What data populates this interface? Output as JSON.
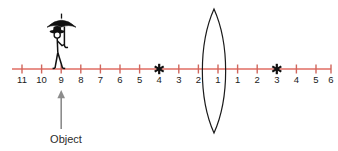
{
  "figure": {
    "kind": "optics-ray-diagram",
    "background_color": "#ffffff",
    "axis": {
      "name": "optical-axis",
      "color": "#e8918a",
      "stroke_width": 2.1,
      "x_start": 12,
      "x_end": 331,
      "y": 69,
      "tick_color": "#d0665c",
      "tick_half_height": 4.5,
      "tick_spacing": 19.6,
      "tick_label_y": 83
    },
    "left_scale": {
      "label": "object-side-distance-scale",
      "labels": [
        "11",
        "10",
        "9",
        "8",
        "7",
        "6",
        "5",
        "4",
        "3",
        "2",
        "1"
      ],
      "x_positions": [
        22.0,
        41.6,
        61.2,
        80.8,
        100.4,
        120.0,
        139.6,
        159.2,
        178.8,
        198.4,
        218.0
      ]
    },
    "right_scale": {
      "label": "image-side-distance-scale",
      "labels": [
        "1",
        "2",
        "3",
        "4",
        "5",
        "6"
      ],
      "x_positions": [
        237.6,
        257.2,
        276.8,
        296.4,
        316.0,
        331.0
      ]
    },
    "lens": {
      "name": "converging-lens",
      "center_x": 214.0,
      "top_y": 9,
      "bottom_y": 133,
      "half_width": 11.5,
      "stroke": "#1a1a1a",
      "stroke_width": 1.2,
      "fill": "none"
    },
    "focal_markers": [
      {
        "name": "focal-point-object-side",
        "glyph": "asterisk",
        "x": 159.2,
        "y": 69,
        "scale_value": "3",
        "color": "#111111"
      },
      {
        "name": "focal-point-image-side",
        "glyph": "asterisk",
        "x": 276.8,
        "y": 69,
        "scale_value": "3",
        "color": "#111111"
      }
    ],
    "object": {
      "name": "object-figure",
      "description": "stick figure wearing hat holding an umbrella",
      "base_x": 61.2,
      "base_y": 69,
      "color": "#111111"
    },
    "pointer": {
      "name": "object-pointer-arrow",
      "x": 61.2,
      "y_tail": 129,
      "y_head": 90,
      "color": "#8c8c8c",
      "stroke_width": 1.6
    },
    "caption": {
      "name": "object-caption",
      "text": "Object",
      "x": 66,
      "y": 143,
      "color": "#2b2b2b"
    }
  }
}
